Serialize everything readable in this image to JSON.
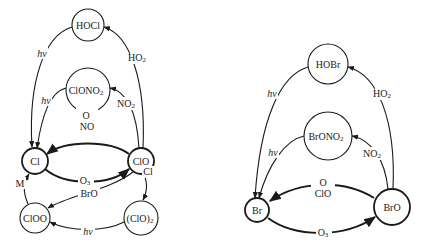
{
  "diagram": {
    "type": "reaction-cycle",
    "left": {
      "title": "Chlorine cycle",
      "nodes": {
        "hocl": "HOCl",
        "clono2_main": "ClONO",
        "clono2_sub": "2",
        "cl": "Cl",
        "clo": "ClO",
        "cloo": "ClOO",
        "clo2_main": "(ClO)",
        "clo2_sub": "2"
      },
      "edges": {
        "hocl_to_cl": "hν",
        "clo_to_hocl_main": "HO",
        "clo_to_hocl_sub": "2",
        "clono2_to_cl": "hν",
        "clo_to_clono2_main": "NO",
        "clo_to_clono2_sub": "2",
        "clo_to_cl_line1": "O",
        "clo_to_cl_line2": "NO",
        "cl_to_clo_main": "O",
        "cl_to_clo_sub": "3",
        "clo_to_cloo": "BrO",
        "clo_to_clo2": "Cl",
        "clo2_to_cloo": "hν",
        "cloo_to_cl": "M"
      }
    },
    "right": {
      "title": "Bromine cycle",
      "nodes": {
        "hobr": "HOBr",
        "brono2_main": "BrONO",
        "brono2_sub": "2",
        "br": "Br",
        "bro": "BrO"
      },
      "edges": {
        "hobr_to_br": "hν",
        "bro_to_hobr_main": "HO",
        "bro_to_hobr_sub": "2",
        "brono2_to_br": "hν",
        "bro_to_brono2_main": "NO",
        "bro_to_brono2_sub": "2",
        "bro_to_br_line1": "O",
        "bro_to_br_line2": "ClO",
        "br_to_bro_main": "O",
        "br_to_bro_sub": "3"
      }
    },
    "colors": {
      "ink": "#1a1a1a",
      "background": "#ffffff"
    }
  }
}
